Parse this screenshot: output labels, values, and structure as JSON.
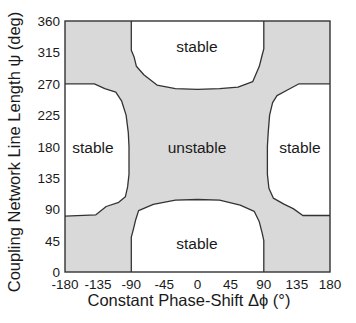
{
  "chart_data": {
    "type": "heatmap",
    "title": "",
    "xlabel": "Constant Phase-Shift Δϕ (°)",
    "ylabel": "Coupling Network Line Length ψ (deg)",
    "xlim": [
      -180,
      180
    ],
    "ylim": [
      0,
      360
    ],
    "x_ticks": [
      "-180",
      "-135",
      "-90",
      "-45",
      "0",
      "45",
      "90",
      "135",
      "180"
    ],
    "y_ticks": [
      "0",
      "45",
      "90",
      "135",
      "180",
      "225",
      "270",
      "315",
      "360"
    ],
    "grid": false,
    "legend": null,
    "colors": {
      "unstable": "#d9d9d9",
      "stable": "#ffffff",
      "boundary": "#333333"
    },
    "regions": [
      {
        "label": "unstable",
        "description": "central cross-shaped region plus the four corners (shaded gray)"
      },
      {
        "label": "stable",
        "position": "top-center",
        "approx_x_range": [
          -90,
          90
        ],
        "approx_y_range": [
          262,
          360
        ]
      },
      {
        "label": "stable",
        "position": "bottom-center",
        "approx_x_range": [
          -90,
          90
        ],
        "approx_y_range": [
          0,
          103
        ]
      },
      {
        "label": "stable",
        "position": "middle-left",
        "approx_x_range": [
          -180,
          -92
        ],
        "approx_y_range": [
          80,
          270
        ]
      },
      {
        "label": "stable",
        "position": "middle-right",
        "approx_x_range": [
          92,
          180
        ],
        "approx_y_range": [
          80,
          270
        ]
      }
    ],
    "boundaries": {
      "top_center": [
        [
          -90,
          360
        ],
        [
          -90,
          318
        ],
        [
          -86,
          308
        ],
        [
          -83,
          295
        ],
        [
          -73,
          283
        ],
        [
          -55,
          268
        ],
        [
          -30,
          263
        ],
        [
          0,
          262
        ],
        [
          30,
          263
        ],
        [
          55,
          265
        ],
        [
          75,
          273
        ],
        [
          84,
          295
        ],
        [
          88,
          312
        ],
        [
          90,
          320
        ],
        [
          90,
          360
        ]
      ],
      "bottom_center": [
        [
          -90,
          0
        ],
        [
          -90,
          50
        ],
        [
          -87,
          62
        ],
        [
          -84,
          75
        ],
        [
          -80,
          88
        ],
        [
          -60,
          97
        ],
        [
          -30,
          103
        ],
        [
          0,
          104
        ],
        [
          30,
          103
        ],
        [
          58,
          96
        ],
        [
          77,
          87
        ],
        [
          84,
          72
        ],
        [
          88,
          55
        ],
        [
          90,
          45
        ],
        [
          90,
          0
        ]
      ],
      "middle_left": [
        [
          -180,
          270
        ],
        [
          -140,
          270
        ],
        [
          -126,
          263
        ],
        [
          -111,
          258
        ],
        [
          -103,
          245
        ],
        [
          -97,
          225
        ],
        [
          -94,
          200
        ],
        [
          -93,
          180
        ],
        [
          -93,
          140
        ],
        [
          -95,
          122
        ],
        [
          -98,
          108
        ],
        [
          -107,
          100
        ],
        [
          -124,
          94
        ],
        [
          -138,
          82
        ],
        [
          -180,
          80
        ]
      ],
      "middle_right": [
        [
          180,
          270
        ],
        [
          138,
          270
        ],
        [
          124,
          262
        ],
        [
          108,
          253
        ],
        [
          102,
          243
        ],
        [
          98,
          225
        ],
        [
          96,
          200
        ],
        [
          95,
          180
        ],
        [
          95,
          140
        ],
        [
          97,
          120
        ],
        [
          103,
          106
        ],
        [
          118,
          97
        ],
        [
          130,
          91
        ],
        [
          143,
          81
        ],
        [
          180,
          81
        ]
      ]
    }
  },
  "labels": {
    "stable_top": "stable",
    "stable_bottom": "stable",
    "stable_left": "stable",
    "stable_right": "stable",
    "unstable_center": "unstable"
  }
}
